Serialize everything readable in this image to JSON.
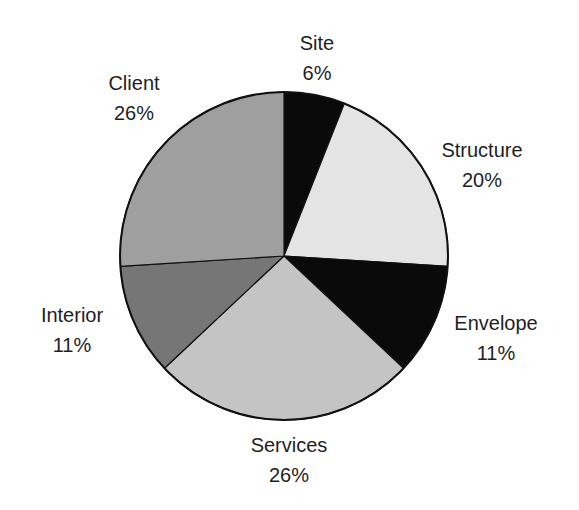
{
  "chart_data": {
    "type": "pie",
    "title": "",
    "categories": [
      "Site",
      "Structure",
      "Envelope",
      "Services",
      "Interior",
      "Client"
    ],
    "values": [
      6,
      20,
      11,
      26,
      11,
      26
    ],
    "unit": "%",
    "start_angle": "12 o'clock",
    "direction": "clockwise",
    "colors": [
      "#0a0a0a",
      "#e4e4e4",
      "#0a0a0a",
      "#c4c4c4",
      "#767676",
      "#9f9f9f"
    ],
    "legend": "none (direct labels outside slices)",
    "labels": [
      {
        "name": "Site",
        "percent": "6%"
      },
      {
        "name": "Structure",
        "percent": "20%"
      },
      {
        "name": "Envelope",
        "percent": "11%"
      },
      {
        "name": "Services",
        "percent": "26%"
      },
      {
        "name": "Interior",
        "percent": "11%"
      },
      {
        "name": "Client",
        "percent": "26%"
      }
    ]
  }
}
